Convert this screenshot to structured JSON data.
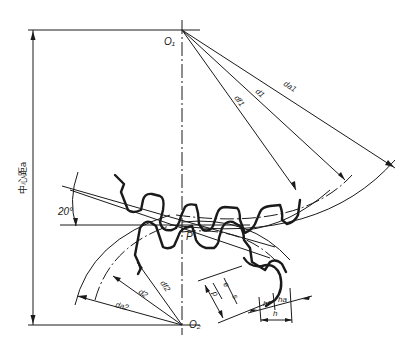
{
  "diagram": {
    "centers": {
      "upper": "O₁",
      "lower": "O₂"
    },
    "pitch_point": "P",
    "center_distance_label": "中心距a",
    "pressure_angle": "20°",
    "upper_gear_labels": {
      "addendum_diameter": "da1",
      "pitch_diameter": "d1",
      "dedendum_diameter": "df1"
    },
    "lower_gear_labels": {
      "addendum_diameter": "da2",
      "pitch_diameter": "d2",
      "dedendum_diameter": "df2"
    },
    "tooth_labels": {
      "space_width": "e",
      "pitch": "p",
      "tooth_thickness": "s",
      "dedendum": "hf",
      "addendum": "ha",
      "tooth_height": "h"
    }
  }
}
